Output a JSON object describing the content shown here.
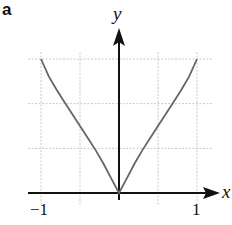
{
  "panel_label": "a",
  "chart_data": {
    "type": "line",
    "title": "",
    "xlabel": "x",
    "ylabel": "y",
    "xlim": [
      -1,
      1
    ],
    "ylim": [
      0,
      1
    ],
    "x_ticks": [
      -1,
      1
    ],
    "x_tick_labels": [
      "-1",
      "1"
    ],
    "grid": true,
    "grid_x": [
      -1,
      -0.5,
      0.5,
      1
    ],
    "grid_y": [
      0.333,
      0.667,
      1
    ],
    "series": [
      {
        "name": "curve",
        "x": [
          -1,
          -0.9,
          -0.8,
          -0.7,
          -0.6,
          -0.5,
          -0.4,
          -0.3,
          -0.2,
          -0.1,
          0,
          0.1,
          0.2,
          0.3,
          0.4,
          0.5,
          0.6,
          0.7,
          0.8,
          0.9,
          1
        ],
        "y": [
          1,
          0.87,
          0.77,
          0.68,
          0.59,
          0.5,
          0.41,
          0.32,
          0.22,
          0.11,
          0,
          0.11,
          0.22,
          0.32,
          0.41,
          0.5,
          0.59,
          0.68,
          0.77,
          0.87,
          1
        ],
        "color": "#666666"
      }
    ]
  },
  "colors": {
    "axis": "#111111",
    "grid": "#bbbbbb",
    "curve": "#6a6a6a"
  }
}
